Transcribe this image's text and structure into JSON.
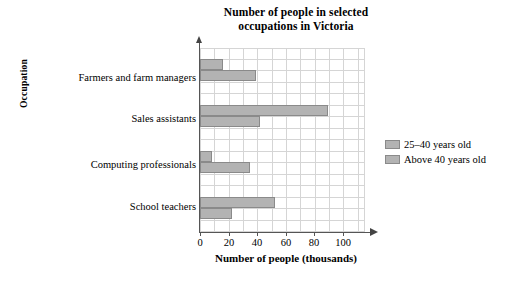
{
  "chart_data": {
    "type": "bar",
    "orientation": "horizontal",
    "title": "Number of people in selected occupations in Victoria",
    "title_line1": "Number of people in selected",
    "title_line2": "occupations in Victoria",
    "xlabel": "Number of people (thousands)",
    "ylabel": "Occupation",
    "categories": [
      "Farmers and farm managers",
      "Sales assistants",
      "Computing professionals",
      "School teachers"
    ],
    "series": [
      {
        "name": "25–40 years old",
        "color": "#b3b3b3",
        "values": [
          15,
          85,
          8,
          50
        ]
      },
      {
        "name": "Above 40 years old",
        "color": "#b3b3b3",
        "values": [
          37,
          40,
          33,
          21
        ]
      }
    ],
    "xlim": [
      0,
      110
    ],
    "xticks": [
      0,
      20,
      40,
      60,
      80,
      100
    ],
    "xtick_labels": [
      "0",
      "20",
      "40",
      "60",
      "80",
      "100"
    ],
    "grid": "both",
    "grid_step_x": 10,
    "legend_position": "right",
    "axis_arrows": true
  },
  "legend": {
    "entries": [
      {
        "label": "25–40 years old",
        "swatch": "legend-swatch-25-40"
      },
      {
        "label": "Above 40 years old",
        "swatch": "legend-swatch-above-40"
      }
    ]
  }
}
